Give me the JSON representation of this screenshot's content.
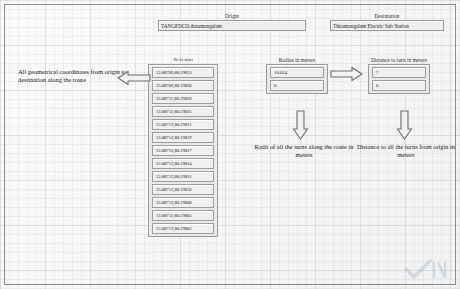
{
  "window": {
    "background_color": "#f4f4f4",
    "border_color": "#8e8e8e"
  },
  "origin": {
    "label": "Origin",
    "value": "TANGEDCO,thirumangalam",
    "placeholder": "Origin"
  },
  "destination": {
    "label": "Destination",
    "value": "Thirumangalam Electric Sub Station",
    "placeholder": "Destination"
  },
  "coordinates": {
    "header": "Next start",
    "items": [
      "13.08709,80.19853",
      "13.08709,80.19830",
      "13.08711,80.19828",
      "13.08712,80.19825",
      "13.08712,80.19821",
      "13.08712,80.19819",
      "13.08712,80.19817",
      "13.08712,80.19814",
      "13.08712,80.19812",
      "13.08712,80.19810",
      "13.08712,80.19808",
      "13.08712,80.19805",
      "13.08712,80.19802"
    ]
  },
  "radius": {
    "label": "Radius in meters",
    "values": [
      "10.014",
      "0"
    ]
  },
  "distance": {
    "label": "Distance to turn in meters",
    "values": [
      "7",
      "0"
    ]
  },
  "annotations": {
    "coordinates": "All geometrical coordinates from origin to destination along the route",
    "radius": "Radii of all the turns along the route in meters",
    "distance": "Distance to all the turns from origin in meters"
  },
  "arrows": {
    "left": "arrow-left-icon",
    "right": "arrow-right-icon",
    "radius_down": "arrow-down-icon",
    "distance_down": "arrow-down-icon"
  },
  "watermark": {
    "label": "checkmark-watermark"
  }
}
